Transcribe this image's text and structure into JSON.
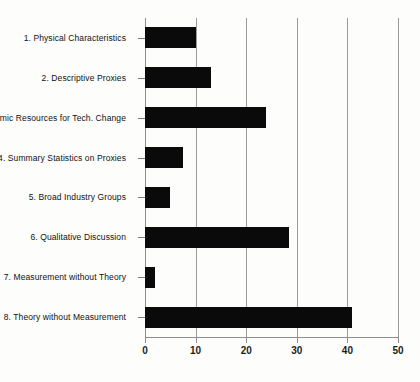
{
  "chart_data": {
    "type": "bar",
    "orientation": "horizontal",
    "title": "",
    "subtitle": "",
    "xlabel": "",
    "ylabel": "",
    "categories": [
      "1. Physical Characteristics",
      "2. Descriptive Proxies",
      "3. Economic Resources for Tech. Change",
      "4. Summary Statistics on Proxies",
      "5. Broad Industry Groups",
      "6. Qualitative Discussion",
      "7. Measurement without Theory",
      "8. Theory without Measurement"
    ],
    "values": [
      10,
      13,
      24,
      7.5,
      5,
      28.5,
      2,
      41
    ],
    "xlim": [
      0,
      50
    ],
    "xticks": [
      0,
      10,
      20,
      30,
      40,
      50
    ],
    "xtick_labels": [
      "0",
      "10",
      "20",
      "30",
      "40",
      "50"
    ],
    "grid": "vertical",
    "legend": "none",
    "bar_color": "#0a0a0a",
    "gridline_color": "#9a9a9a",
    "axis_color": "#8d8d8d",
    "background_color": "#fdfdfb"
  }
}
